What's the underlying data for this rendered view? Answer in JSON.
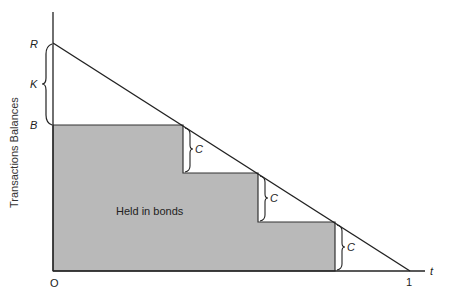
{
  "diagram": {
    "type": "sawtooth-inventory",
    "y_axis_label": "Transactions Balances",
    "x_axis_label": "t",
    "origin_label": "O",
    "x_end_label": "1",
    "y_labels": {
      "R": "R",
      "K": "K",
      "B": "B"
    },
    "region_label": "Held in bonds",
    "step_label": "C",
    "colors": {
      "line": "#222222",
      "fill": "#b9b9b9",
      "background": "#ffffff"
    },
    "steps": [
      {
        "x": 183,
        "top": 125,
        "bottom": 173,
        "label": "C"
      },
      {
        "x": 258,
        "top": 173,
        "bottom": 222,
        "label": "C"
      },
      {
        "x": 335,
        "top": 222,
        "bottom": 271,
        "label": "C"
      }
    ]
  }
}
